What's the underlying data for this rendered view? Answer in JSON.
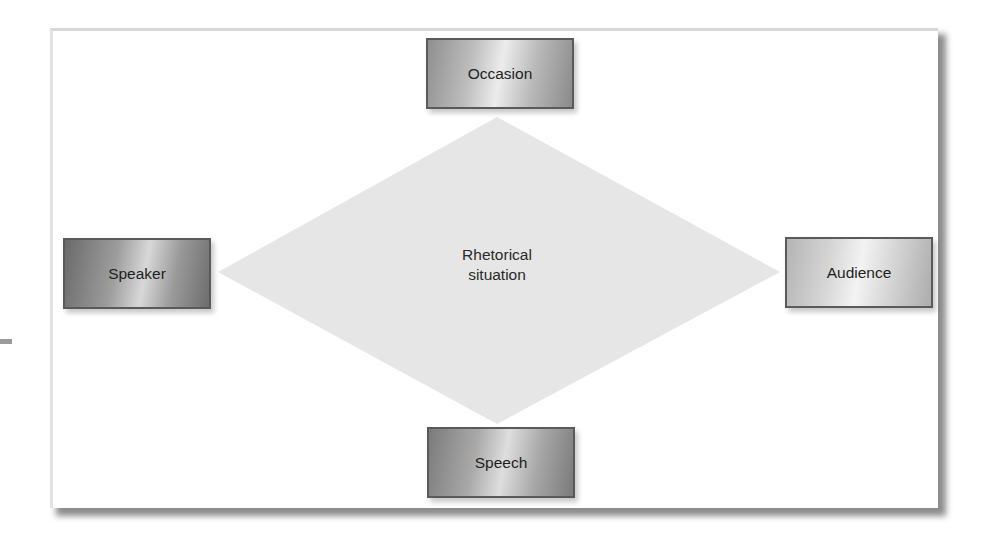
{
  "diagram": {
    "center": {
      "label_line1": "Rhetorical",
      "label_line2": "situation",
      "shape": "diamond",
      "fill": "#e6e6e6"
    },
    "nodes": [
      {
        "id": "occasion",
        "label": "Occasion",
        "position": "top"
      },
      {
        "id": "speaker",
        "label": "Speaker",
        "position": "left"
      },
      {
        "id": "audience",
        "label": "Audience",
        "position": "right"
      },
      {
        "id": "speech",
        "label": "Speech",
        "position": "bottom"
      }
    ],
    "colors": {
      "frame_background": "#ffffff",
      "frame_shadow": "#8c8c8c",
      "node_border": "#5a5a5a",
      "text": "#1e1e1e"
    }
  }
}
